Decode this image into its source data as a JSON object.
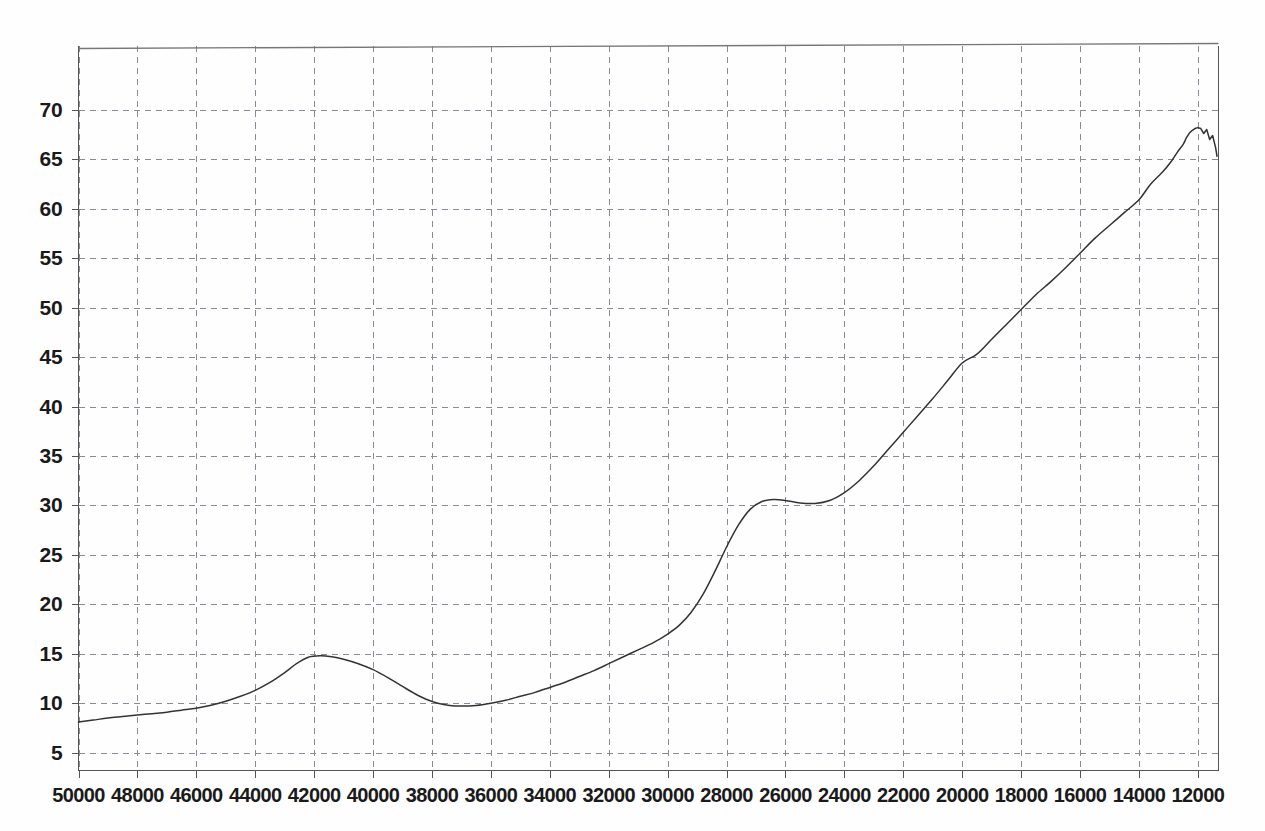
{
  "chart_data": {
    "type": "line",
    "title": "",
    "subtitle": "",
    "xlabel": "",
    "ylabel": "",
    "grid": true,
    "legend": null,
    "x_axis_reversed": true,
    "xlim": [
      50000,
      11300
    ],
    "ylim": [
      3.2,
      76.5
    ],
    "xticks": [
      50000,
      48000,
      46000,
      44000,
      42000,
      40000,
      38000,
      36000,
      34000,
      32000,
      30000,
      28000,
      26000,
      24000,
      22000,
      20000,
      18000,
      16000,
      14000,
      12000
    ],
    "xtick_labels": [
      "50000",
      "48000",
      "46000",
      "44000",
      "42000",
      "40000",
      "38000",
      "36000",
      "34000",
      "32000",
      "30000",
      "28000",
      "26000",
      "24000",
      "22000",
      "20000",
      "18000",
      "16000",
      "14000",
      "12000"
    ],
    "yticks": [
      5,
      10,
      15,
      20,
      25,
      30,
      35,
      40,
      45,
      50,
      55,
      60,
      65,
      70
    ],
    "ytick_labels": [
      "5",
      "10",
      "15",
      "20",
      "25",
      "30",
      "35",
      "40",
      "45",
      "50",
      "55",
      "60",
      "65",
      "70"
    ],
    "line_color": "#333333",
    "grid_color": "#8a8a96",
    "axis_color": "#555555",
    "series": [
      {
        "name": "curve",
        "x": [
          50000,
          49500,
          49000,
          48500,
          48000,
          47500,
          47000,
          46500,
          46000,
          45500,
          45000,
          44500,
          44000,
          43500,
          43000,
          42600,
          42200,
          41800,
          41400,
          41000,
          40500,
          40000,
          39500,
          39000,
          38600,
          38200,
          37800,
          37400,
          37000,
          36500,
          36000,
          35500,
          35000,
          34500,
          34000,
          33500,
          33000,
          32500,
          32000,
          31500,
          31000,
          30500,
          30000,
          29600,
          29200,
          28800,
          28400,
          28000,
          27600,
          27200,
          26800,
          26400,
          26000,
          25500,
          25000,
          24500,
          24000,
          23500,
          23000,
          22500,
          22000,
          21500,
          21000,
          20500,
          20000,
          19500,
          19000,
          18500,
          18000,
          17500,
          17000,
          16500,
          16000,
          15500,
          15000,
          14500,
          14000,
          13600,
          13200,
          12900,
          12700,
          12500,
          12400,
          12300,
          12200,
          12100,
          12000,
          11900,
          11800,
          11700,
          11600,
          11500,
          11400,
          11350
        ],
        "y": [
          8.1,
          8.3,
          8.5,
          8.65,
          8.8,
          8.95,
          9.1,
          9.3,
          9.5,
          9.8,
          10.2,
          10.7,
          11.3,
          12.1,
          13.1,
          14.0,
          14.65,
          14.8,
          14.7,
          14.45,
          14.0,
          13.4,
          12.6,
          11.7,
          11.0,
          10.4,
          10.0,
          9.78,
          9.72,
          9.78,
          10.0,
          10.3,
          10.7,
          11.1,
          11.6,
          12.1,
          12.7,
          13.3,
          14.0,
          14.7,
          15.4,
          16.1,
          17.0,
          17.9,
          19.2,
          21.0,
          23.3,
          25.8,
          28.0,
          29.6,
          30.4,
          30.6,
          30.5,
          30.25,
          30.2,
          30.5,
          31.3,
          32.5,
          34.0,
          35.7,
          37.4,
          39.1,
          40.8,
          42.6,
          44.4,
          45.3,
          46.8,
          48.3,
          49.8,
          51.3,
          52.6,
          54.0,
          55.5,
          57.0,
          58.3,
          59.6,
          60.9,
          62.5,
          63.7,
          64.8,
          65.7,
          66.5,
          67.1,
          67.6,
          67.9,
          68.1,
          68.2,
          68.1,
          67.6,
          68.0,
          67.0,
          67.4,
          66.2,
          65.3
        ]
      }
    ],
    "annotations": [
      {
        "name": "right-edge-noise",
        "description": "small high-frequency oscillation near right end of trace"
      }
    ]
  },
  "axes": {
    "top_border_visible": true,
    "right_border_visible": true,
    "left_border_visible": true,
    "bottom_border_visible": true
  }
}
